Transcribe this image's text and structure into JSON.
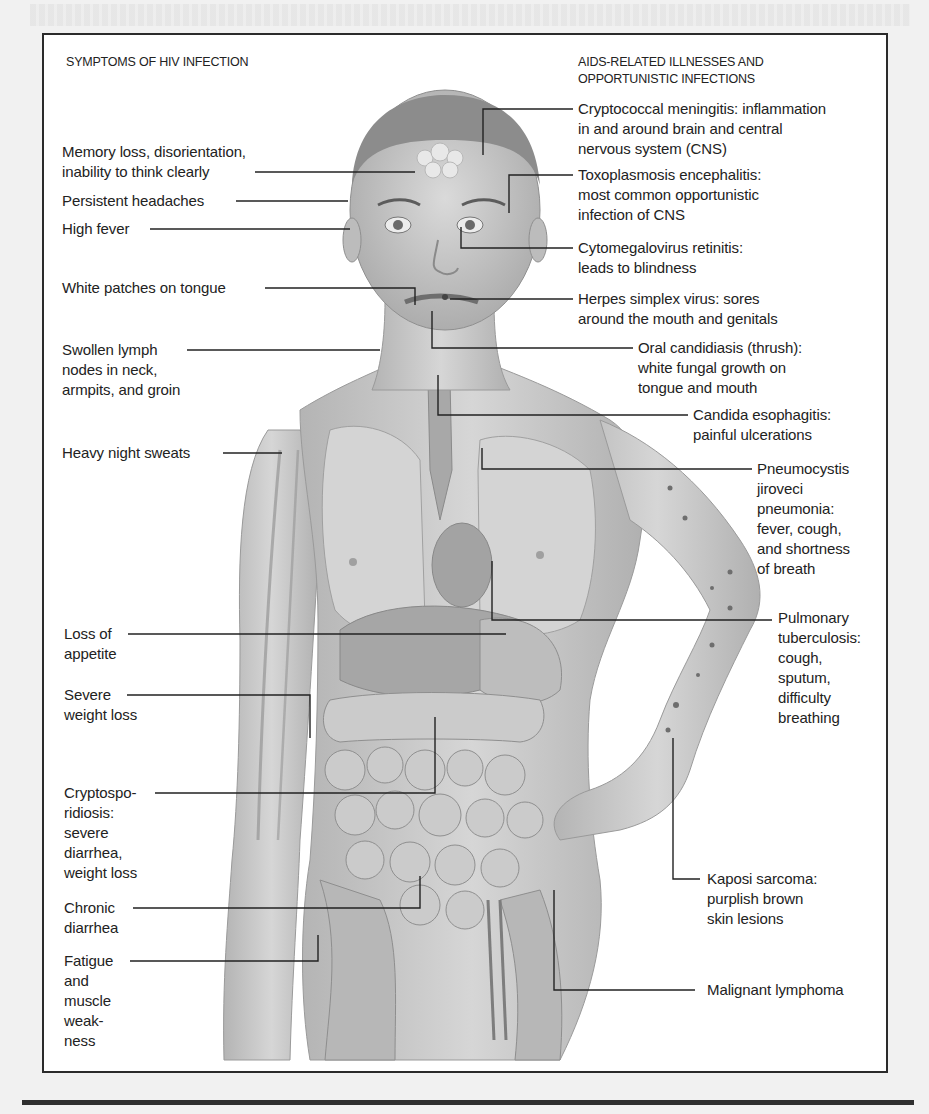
{
  "figure": {
    "left_heading": "SYMPTOMS OF HIV INFECTION",
    "right_heading_line1": "AIDS-RELATED ILLNESSES AND",
    "right_heading_line2": "OPPORTUNISTIC INFECTIONS",
    "symptoms": [
      {
        "lines": [
          "Memory loss, disorientation,",
          "inability to think clearly"
        ]
      },
      {
        "lines": [
          "Persistent headaches"
        ]
      },
      {
        "lines": [
          "High fever"
        ]
      },
      {
        "lines": [
          "White patches on tongue"
        ]
      },
      {
        "lines": [
          "Swollen lymph",
          "nodes in neck,",
          "armpits, and groin"
        ]
      },
      {
        "lines": [
          "Heavy night sweats"
        ]
      },
      {
        "lines": [
          "Loss of",
          "appetite"
        ]
      },
      {
        "lines": [
          "Severe",
          "weight loss"
        ]
      },
      {
        "lines": [
          "Cryptospo-",
          "ridiosis:",
          "severe",
          "diarrhea,",
          "weight loss"
        ]
      },
      {
        "lines": [
          "Chronic",
          "diarrhea"
        ]
      },
      {
        "lines": [
          "Fatigue",
          "and",
          "muscle",
          "weak-",
          "ness"
        ]
      }
    ],
    "illnesses": [
      {
        "lines": [
          "Cryptococcal meningitis: inflammation",
          "in and around brain and central",
          "nervous system (CNS)"
        ]
      },
      {
        "lines": [
          "Toxoplasmosis encephalitis:",
          "most common opportunistic",
          "infection of CNS"
        ]
      },
      {
        "lines": [
          "Cytomegalovirus retinitis:",
          "leads to blindness"
        ]
      },
      {
        "lines": [
          "Herpes simplex virus: sores",
          "around the mouth and genitals"
        ]
      },
      {
        "lines": [
          "Oral candidiasis (thrush):",
          "white fungal growth on",
          "tongue and mouth"
        ]
      },
      {
        "lines": [
          "Candida esophagitis:",
          "painful ulcerations"
        ]
      },
      {
        "lines": [
          "Pneumocystis",
          "jiroveci",
          "pneumonia:",
          "fever, cough,",
          "and shortness",
          "of breath"
        ]
      },
      {
        "lines": [
          "Pulmonary",
          "tuberculosis:",
          "cough,",
          "sputum,",
          "difficulty",
          "breathing"
        ]
      },
      {
        "lines": [
          "Kaposi sarcoma:",
          "purplish brown",
          "skin lesions"
        ]
      },
      {
        "lines": [
          "Malignant lymphoma"
        ]
      }
    ]
  },
  "colors": {
    "frame": "#2b2b2b",
    "text": "#222222",
    "skin": "#c9c9c9",
    "skin_dark": "#9e9e9e",
    "organ": "#b3b3b3",
    "lesion": "#6e6e6e"
  }
}
